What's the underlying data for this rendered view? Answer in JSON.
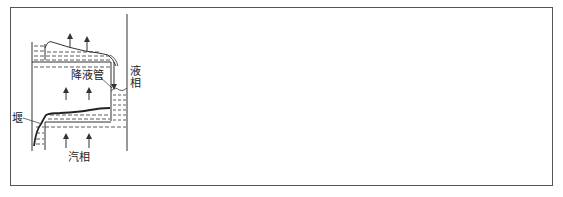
{
  "diagram": {
    "title": "",
    "labels": {
      "downcomer": "降液管",
      "liquid_phase": "液相",
      "weir": "堰",
      "vapor_phase": "汽相"
    },
    "colors": {
      "stroke": "#333333",
      "frame": "#555555",
      "background": "#ffffff"
    }
  }
}
